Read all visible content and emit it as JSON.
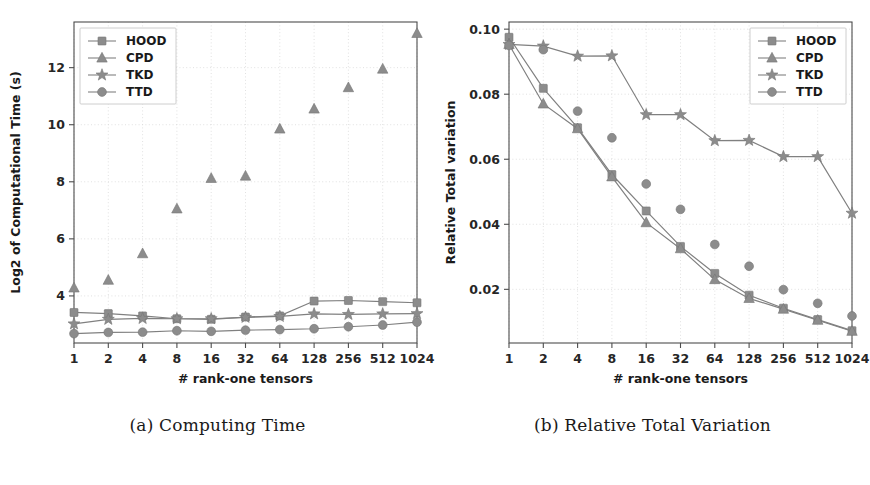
{
  "figure": {
    "panels": [
      {
        "caption": "(a) Computing Time",
        "legend_position": "upper-left"
      },
      {
        "caption": "(b) Relative Total Variation",
        "legend_position": "upper-right"
      }
    ]
  },
  "chart_data": [
    {
      "type": "line",
      "title": "(a) Computing Time",
      "xlabel": "# rank-one tensors",
      "ylabel": "Log2 of Computational Time (s)",
      "categories": [
        "1",
        "2",
        "4",
        "8",
        "16",
        "32",
        "64",
        "128",
        "256",
        "512",
        "1024"
      ],
      "x_tick_labels": [
        "1",
        "2",
        "4",
        "8",
        "16",
        "32",
        "64",
        "128",
        "256",
        "512",
        "1024"
      ],
      "y_tick_labels": [
        "4",
        "6",
        "8",
        "10",
        "12"
      ],
      "y_ticks": [
        4,
        6,
        8,
        10,
        12
      ],
      "ylim": [
        2.35,
        13.6
      ],
      "grid": true,
      "legend": [
        "HOOD",
        "CPD",
        "TKD",
        "TTD"
      ],
      "series": [
        {
          "name": "HOOD",
          "marker": "square",
          "line": true,
          "values": [
            3.42,
            3.38,
            3.3,
            3.2,
            3.18,
            3.26,
            3.3,
            3.82,
            3.84,
            3.8,
            3.76
          ]
        },
        {
          "name": "CPD",
          "marker": "triangle",
          "line": false,
          "values": [
            4.28,
            4.55,
            5.48,
            7.05,
            8.12,
            8.2,
            9.85,
            10.55,
            11.3,
            11.95,
            13.2
          ]
        },
        {
          "name": "TKD",
          "marker": "star",
          "line": true,
          "values": [
            3.02,
            3.18,
            3.21,
            3.2,
            3.2,
            3.25,
            3.28,
            3.37,
            3.35,
            3.37,
            3.38
          ]
        },
        {
          "name": "TTD",
          "marker": "circle",
          "line": true,
          "values": [
            2.68,
            2.72,
            2.73,
            2.78,
            2.76,
            2.8,
            2.82,
            2.85,
            2.92,
            2.98,
            3.08
          ]
        }
      ]
    },
    {
      "type": "line",
      "title": "(b) Relative Total Variation",
      "xlabel": "# rank-one tensors",
      "ylabel": "Relative Total variation",
      "categories": [
        "1",
        "2",
        "4",
        "8",
        "16",
        "32",
        "64",
        "128",
        "256",
        "512",
        "1024"
      ],
      "x_tick_labels": [
        "1",
        "2",
        "4",
        "8",
        "16",
        "32",
        "64",
        "128",
        "256",
        "512",
        "1024"
      ],
      "y_tick_labels": [
        "0.02",
        "0.04",
        "0.06",
        "0.08",
        "0.10"
      ],
      "y_ticks": [
        0.02,
        0.04,
        0.06,
        0.08,
        0.1
      ],
      "ylim": [
        0.0035,
        0.1022
      ],
      "grid": true,
      "legend": [
        "HOOD",
        "CPD",
        "TKD",
        "TTD"
      ],
      "series": [
        {
          "name": "HOOD",
          "marker": "square",
          "line": true,
          "values": [
            0.0975,
            0.0818,
            0.0697,
            0.0553,
            0.0441,
            0.0332,
            0.0249,
            0.0182,
            0.0142,
            0.0107,
            0.0073
          ]
        },
        {
          "name": "CPD",
          "marker": "triangle",
          "line": true,
          "values": [
            0.0953,
            0.077,
            0.0694,
            0.0546,
            0.0405,
            0.0325,
            0.023,
            0.0172,
            0.0139,
            0.0105,
            0.0071
          ]
        },
        {
          "name": "TKD",
          "marker": "star",
          "line": true,
          "values": [
            0.0953,
            0.0948,
            0.0917,
            0.0918,
            0.0737,
            0.0737,
            0.0657,
            0.0658,
            0.0608,
            0.0608,
            0.0434
          ]
        },
        {
          "name": "TTD",
          "marker": "circle",
          "line": false,
          "values": [
            0.095,
            0.0937,
            0.0748,
            0.0666,
            0.0524,
            0.0446,
            0.0338,
            0.0271,
            0.0199,
            0.0157,
            0.0118
          ]
        }
      ]
    }
  ]
}
